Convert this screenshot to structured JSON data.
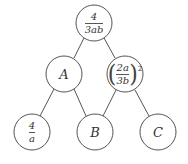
{
  "diagram": {
    "type": "tree-pyramid",
    "stroke_color": "#555555",
    "nodes": {
      "top": {
        "numerator": "4",
        "denominator": "3ab"
      },
      "mid_left": {
        "label": "A"
      },
      "mid_right": {
        "numerator": "2a",
        "denominator": "3b",
        "exponent": "2"
      },
      "bottom_left": {
        "numerator": "4",
        "denominator": "a"
      },
      "bottom_mid": {
        "label": "B"
      },
      "bottom_right": {
        "label": "C"
      }
    },
    "edges": [
      [
        "top",
        "mid_left"
      ],
      [
        "top",
        "mid_right"
      ],
      [
        "mid_left",
        "bottom_left"
      ],
      [
        "mid_left",
        "bottom_mid"
      ],
      [
        "mid_right",
        "bottom_mid"
      ],
      [
        "mid_right",
        "bottom_right"
      ]
    ]
  }
}
